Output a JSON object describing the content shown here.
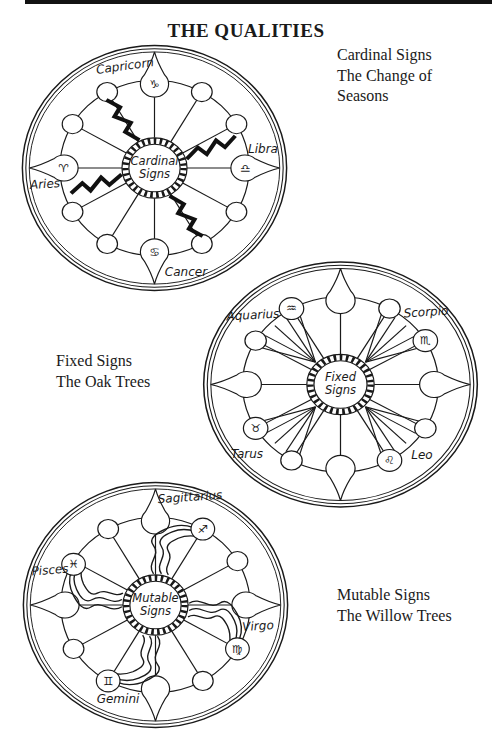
{
  "page": {
    "title": "THE QUALITIES"
  },
  "captions": {
    "cardinal": {
      "line1": "Cardinal Signs",
      "line2": "The Change of",
      "line3": "Seasons"
    },
    "fixed": {
      "line1": "Fixed Signs",
      "line2": "The Oak Trees"
    },
    "mutable": {
      "line1": "Mutable Signs",
      "line2": "The Willow Trees"
    }
  },
  "wheels": {
    "cardinal": {
      "hub_line1": "Cardinal",
      "hub_line2": "Signs",
      "labels": {
        "top": "Capricorn",
        "right": "Libra",
        "left": "Aries",
        "bottom": "Cancer"
      },
      "glyphs": {
        "top": "♑",
        "right": "♎",
        "left": "♈",
        "bottom": "♋"
      },
      "decoration": "lightning-bolt-icon"
    },
    "fixed": {
      "hub_line1": "Fixed",
      "hub_line2": "Signs",
      "labels": {
        "upper_left": "Aquarius",
        "upper_right": "Scorpio",
        "lower_left": "Tarus",
        "lower_right": "Leo"
      },
      "glyphs": {
        "upper_left": "♒",
        "upper_right": "♏",
        "lower_left": "♉",
        "lower_right": "♌"
      },
      "decoration": "ray-fan-icon"
    },
    "mutable": {
      "hub_line1": "Mutable",
      "hub_line2": "Signs",
      "labels": {
        "upper_right": "Sagittarius",
        "upper_left": "Pisces",
        "lower_right": "Virgo",
        "lower_left": "Gemini"
      },
      "glyphs": {
        "upper_right": "♐",
        "upper_left": "♓",
        "lower_right": "♍",
        "lower_left": "♊"
      },
      "decoration": "willow-wave-icon"
    }
  },
  "colors": {
    "ink": "#1a1a1a",
    "paper": "#ffffff"
  }
}
